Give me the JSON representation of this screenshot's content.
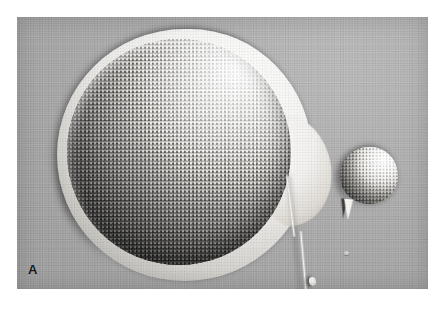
{
  "figure": {
    "panel_label": "A",
    "modality": "scanning-electron-micrograph",
    "background_tone": "#a9a9a9",
    "plate_background": "#ffffff"
  },
  "specimens": {
    "large_cell": {
      "name": "large-granular-sphere",
      "surface": "dense microvillous granules",
      "envelope": "smooth bright outer envelope",
      "highlight_color": "#fbfbfa",
      "shadow_color": "#211f1d"
    },
    "small_cell": {
      "name": "small-granular-sphere",
      "surface": "granular",
      "highlight_color": "#fdfdfc",
      "shadow_color": "#464340"
    },
    "filament": {
      "name": "thin-filament-tail",
      "color": "#fbfbf9"
    },
    "wedge": {
      "name": "wedge-fragment",
      "color": "#f6f5f2"
    }
  }
}
